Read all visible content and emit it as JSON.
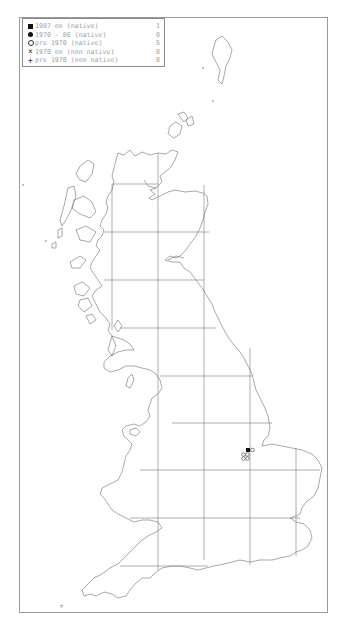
{
  "legend": {
    "items": [
      {
        "symbol": "filled-square",
        "label": "1987 on (native)",
        "count": "1"
      },
      {
        "symbol": "filled-circle",
        "label": "1970 - 86 (native)",
        "count": "0"
      },
      {
        "symbol": "open-circle",
        "label": "pre 1970 (native)",
        "count": "5"
      },
      {
        "symbol": "cross",
        "label": "1970 on (non native)",
        "count": "0"
      },
      {
        "symbol": "plus",
        "label": "pre 1970 (non native)",
        "count": "0"
      }
    ]
  },
  "map": {
    "region": "Great Britain",
    "grid_color": "#7a7a7a",
    "coast_color": "#6e6e6e",
    "records": [
      {
        "type": "filled-square",
        "x": 248,
        "y": 450
      },
      {
        "type": "open-circle",
        "x": 252.5,
        "y": 450
      },
      {
        "type": "open-circle",
        "x": 243.5,
        "y": 454.5
      },
      {
        "type": "open-circle",
        "x": 247.5,
        "y": 454.5
      },
      {
        "type": "open-circle",
        "x": 243.5,
        "y": 458.5
      },
      {
        "type": "open-circle",
        "x": 247.5,
        "y": 458.5
      }
    ]
  }
}
